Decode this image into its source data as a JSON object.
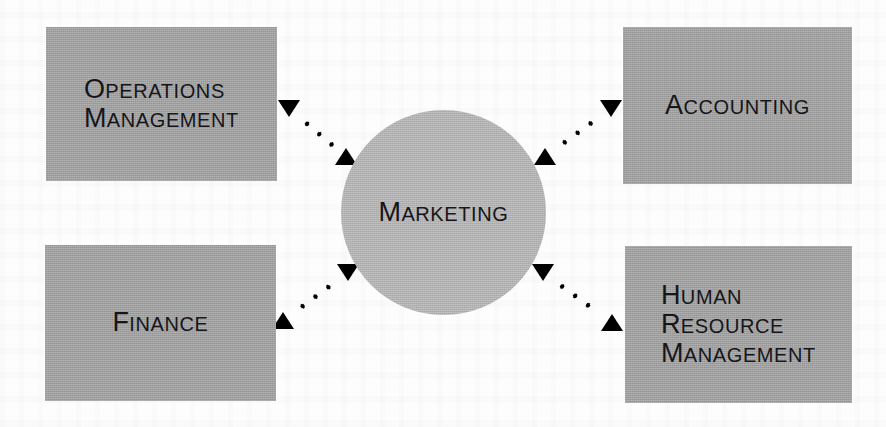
{
  "diagram": {
    "type": "hub-and-spoke",
    "palette": {
      "page_background": "#fdfdfd",
      "box_fill": "#a3a3a3",
      "circle_fill": "#b8b8b8",
      "text": "#16161a",
      "connector": "#000000"
    },
    "center": {
      "shape": "circle",
      "label": "Marketing",
      "cap": "M",
      "rest": "ARKETING",
      "x": 341,
      "y": 110,
      "size": 205
    },
    "nodes": [
      {
        "id": "operations-management",
        "shape": "rectangle",
        "position": "top-left",
        "label": "Operations Management",
        "lines": [
          {
            "cap": "O",
            "rest": "PERATIONS"
          },
          {
            "cap": "M",
            "rest": "ANAGEMENT"
          }
        ],
        "align": "left",
        "x": 46,
        "y": 27,
        "width": 231,
        "height": 154
      },
      {
        "id": "accounting",
        "shape": "rectangle",
        "position": "top-right",
        "label": "Accounting",
        "lines": [
          {
            "cap": "A",
            "rest": "CCOUNTING"
          }
        ],
        "align": "center",
        "x": 623,
        "y": 27,
        "width": 229,
        "height": 157
      },
      {
        "id": "finance",
        "shape": "rectangle",
        "position": "bottom-left",
        "label": "Finance",
        "lines": [
          {
            "cap": "F",
            "rest": "INANCE"
          }
        ],
        "align": "center",
        "x": 45,
        "y": 245,
        "width": 231,
        "height": 156
      },
      {
        "id": "human-resource-management",
        "shape": "rectangle",
        "position": "bottom-right",
        "label": "Human Resource Management",
        "lines": [
          {
            "cap": "H",
            "rest": "UMAN"
          },
          {
            "cap": "R",
            "rest": "ESOURCE"
          },
          {
            "cap": "M",
            "rest": "ANAGEMENT"
          }
        ],
        "align": "left",
        "x": 625,
        "y": 246,
        "width": 227,
        "height": 157
      }
    ],
    "connectors": [
      {
        "id": "connector-operations-management",
        "from": "operations-management",
        "to": "center",
        "style": "dotted",
        "direction": "bidirectional",
        "dot_count": 5,
        "start_x": 289,
        "start_y": 108,
        "end_x": 346,
        "end_y": 156,
        "head_start": "down",
        "head_end": "up"
      },
      {
        "id": "connector-accounting",
        "from": "center",
        "to": "accounting",
        "style": "dotted",
        "direction": "bidirectional",
        "dot_count": 5,
        "start_x": 545,
        "start_y": 156,
        "end_x": 611,
        "end_y": 108,
        "head_start": "up",
        "head_end": "down"
      },
      {
        "id": "connector-finance",
        "from": "finance",
        "to": "center",
        "style": "dotted",
        "direction": "bidirectional",
        "dot_count": 5,
        "start_x": 283,
        "start_y": 320,
        "end_x": 348,
        "end_y": 272,
        "head_start": "up",
        "head_end": "down"
      },
      {
        "id": "connector-human-resource-management",
        "from": "center",
        "to": "human-resource-management",
        "style": "dotted",
        "direction": "bidirectional",
        "dot_count": 5,
        "start_x": 543,
        "start_y": 272,
        "end_x": 612,
        "end_y": 322,
        "head_start": "down",
        "head_end": "up"
      }
    ]
  }
}
